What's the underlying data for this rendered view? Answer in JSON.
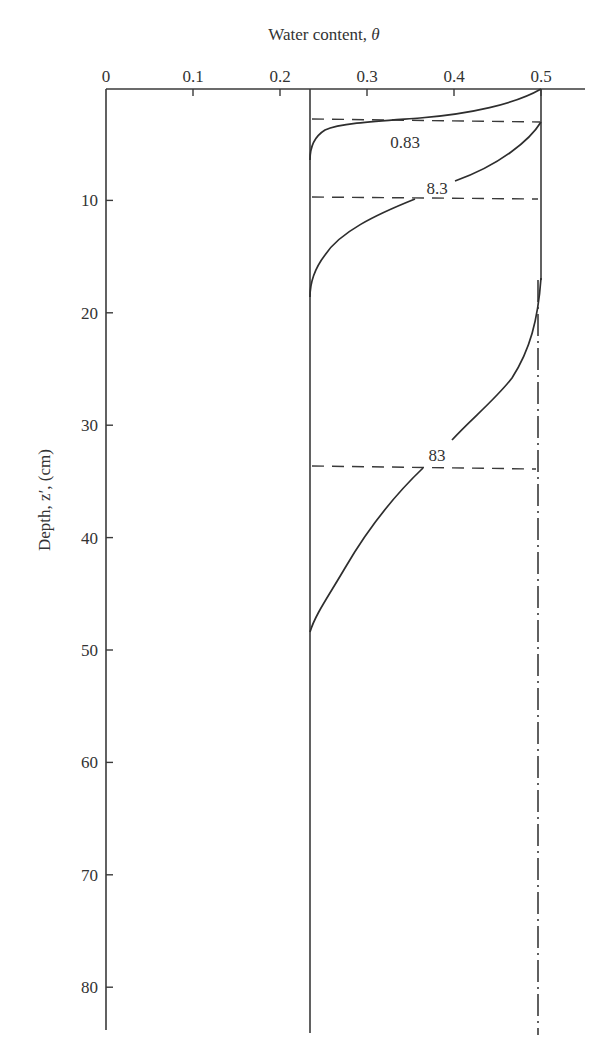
{
  "chart_data": {
    "type": "line",
    "title": "",
    "xlabel": "Water content, θ",
    "xlabel_parts": {
      "text": "Water content, ",
      "symbol": "θ"
    },
    "ylabel": "Depth, z′, (cm)",
    "xlim": [
      0,
      0.55
    ],
    "ylim": [
      85,
      0
    ],
    "x_axis_position": "top",
    "y_axis_inverted": true,
    "grid": false,
    "x_ticks": [
      "0",
      "0.1",
      "0.2",
      "0.3",
      "0.4",
      "0.5"
    ],
    "x_tick_values": [
      0,
      0.1,
      0.2,
      0.3,
      0.4,
      0.5
    ],
    "y_ticks": [
      "10",
      "20",
      "30",
      "40",
      "50",
      "60",
      "70",
      "80"
    ],
    "y_tick_values": [
      10,
      20,
      30,
      40,
      50,
      60,
      70,
      80
    ],
    "reference_lines": [
      {
        "name": "initial water content",
        "orientation": "vertical",
        "x": 0.235,
        "style": "solid"
      },
      {
        "name": "saturated water content (upper)",
        "orientation": "vertical",
        "x": 0.5,
        "y_range": [
          0,
          17
        ],
        "style": "solid"
      },
      {
        "name": "saturated water content",
        "orientation": "vertical",
        "x": 0.496,
        "y_range": [
          17,
          84
        ],
        "style": "dash-dot"
      }
    ],
    "series": [
      {
        "name": "0.83",
        "label": "0.83",
        "points": [
          [
            0.5,
            0.0
          ],
          [
            0.46,
            1.4
          ],
          [
            0.4,
            2.4
          ],
          [
            0.36,
            2.8
          ],
          [
            0.3,
            3.3
          ],
          [
            0.26,
            4.0
          ],
          [
            0.24,
            5.0
          ],
          [
            0.235,
            6.4
          ]
        ],
        "wetting_front_depth": 2.8
      },
      {
        "name": "8.3",
        "label": "8.3",
        "points": [
          [
            0.5,
            2.8
          ],
          [
            0.48,
            4.5
          ],
          [
            0.44,
            7.0
          ],
          [
            0.4,
            8.6
          ],
          [
            0.37,
            9.7
          ],
          [
            0.32,
            11.5
          ],
          [
            0.28,
            13.5
          ],
          [
            0.25,
            15.8
          ],
          [
            0.238,
            17.5
          ],
          [
            0.235,
            18.6
          ]
        ],
        "wetting_front_depth": 9.7
      },
      {
        "name": "83",
        "label": "83",
        "points": [
          [
            0.5,
            17.0
          ],
          [
            0.49,
            22.0
          ],
          [
            0.47,
            26.0
          ],
          [
            0.44,
            29.0
          ],
          [
            0.4,
            31.6
          ],
          [
            0.37,
            33.7
          ],
          [
            0.33,
            36.6
          ],
          [
            0.29,
            41.0
          ],
          [
            0.26,
            44.8
          ],
          [
            0.243,
            47.0
          ],
          [
            0.235,
            48.4
          ]
        ],
        "wetting_front_depth": 33.7
      }
    ],
    "annotations": [
      {
        "text": "0.83",
        "x": 0.345,
        "y": 4.8
      },
      {
        "text": "8.3",
        "x": 0.385,
        "y": 8.9
      },
      {
        "text": "83",
        "x": 0.38,
        "y": 32.7
      }
    ]
  }
}
